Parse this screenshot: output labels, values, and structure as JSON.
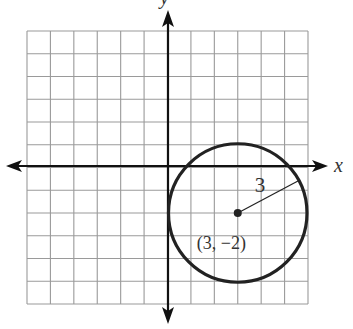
{
  "figure": {
    "type": "coordinate-plane-circle",
    "axes": {
      "x_label": "x",
      "y_label": "y"
    },
    "grid": {
      "columns": 12,
      "rows": 12,
      "x_min": -6,
      "x_max": 6,
      "y_min": -6,
      "y_max": 6
    },
    "circle": {
      "center": {
        "x": 3,
        "y": -2
      },
      "radius": 3,
      "center_label": "(3, −2)",
      "radius_label": "3"
    },
    "colors": {
      "grid": "#9a9a9a",
      "axis": "#111111",
      "curve": "#222222",
      "text": "#333333"
    }
  }
}
